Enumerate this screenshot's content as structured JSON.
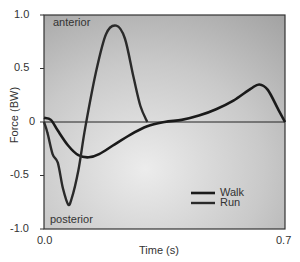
{
  "chart_data": {
    "type": "line",
    "title": "",
    "xlabel": "Time (s)",
    "ylabel": "Force (BW)",
    "xlim": [
      0.0,
      0.7
    ],
    "ylim": [
      -1.0,
      1.0
    ],
    "x_ticks": [
      "0.0",
      "0.7"
    ],
    "y_ticks": [
      "1.0",
      "0.5",
      "0",
      "-0.5",
      "-1.0"
    ],
    "grid": false,
    "legend_position": "lower right",
    "annotations": [
      {
        "text": "anterior",
        "position": "top-left"
      },
      {
        "text": "posterior",
        "position": "bottom-left"
      }
    ],
    "series": [
      {
        "name": "Walk",
        "x": [
          0.0,
          0.02,
          0.04,
          0.07,
          0.1,
          0.13,
          0.16,
          0.2,
          0.25,
          0.3,
          0.35,
          0.4,
          0.45,
          0.5,
          0.55,
          0.6,
          0.625,
          0.65,
          0.68,
          0.7
        ],
        "y": [
          0.04,
          0.02,
          -0.08,
          -0.22,
          -0.31,
          -0.33,
          -0.3,
          -0.22,
          -0.12,
          -0.04,
          0.0,
          0.02,
          0.06,
          0.12,
          0.2,
          0.31,
          0.35,
          0.3,
          0.12,
          0.0
        ]
      },
      {
        "name": "Run",
        "x": [
          0.0,
          0.01,
          0.025,
          0.04,
          0.055,
          0.07,
          0.08,
          0.1,
          0.12,
          0.15,
          0.18,
          0.21,
          0.235,
          0.26,
          0.28,
          0.3
        ],
        "y": [
          0.0,
          -0.1,
          -0.3,
          -0.38,
          -0.62,
          -0.77,
          -0.72,
          -0.45,
          -0.05,
          0.45,
          0.82,
          0.9,
          0.78,
          0.42,
          0.15,
          0.0
        ]
      }
    ]
  },
  "axes": {
    "xlabel": "Time (s)",
    "ylabel": "Force (BW)",
    "x_ticks": [
      "0.0",
      "0.7"
    ],
    "y_ticks": [
      "1.0",
      "0.5",
      "0",
      "-0.5",
      "-1.0"
    ]
  },
  "annotations": {
    "top": "anterior",
    "bottom": "posterior"
  },
  "legend": {
    "walk": "Walk",
    "run": "Run"
  },
  "colors": {
    "plot_bg_light": "#e8e8e8",
    "plot_bg_dark": "#a9a9a9",
    "line": "#1a1a1a",
    "frame": "#333333"
  }
}
